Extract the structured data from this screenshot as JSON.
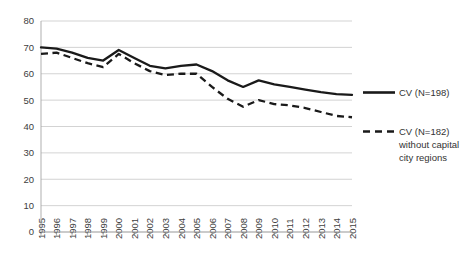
{
  "chart_data": {
    "type": "line",
    "title": "",
    "subtitle": "",
    "xlabel": "",
    "ylabel": "",
    "grid": true,
    "legend_position": "right",
    "ylim": [
      0,
      80
    ],
    "ytick_labels": [
      "80",
      "70",
      "60",
      "50",
      "40",
      "30",
      "20",
      "10",
      "0"
    ],
    "yticks": [
      80,
      70,
      60,
      50,
      40,
      30,
      20,
      10,
      0
    ],
    "categories": [
      "1995",
      "1996",
      "1997",
      "1998",
      "1999",
      "2000",
      "2001",
      "2002",
      "2003",
      "2004",
      "2005",
      "2006",
      "2007",
      "2008",
      "2009",
      "2010",
      "2011",
      "2012",
      "2013",
      "2014",
      "2015"
    ],
    "series": [
      {
        "name": "CV (N=198)",
        "style": "solid",
        "color": "#1a1a1a",
        "values": [
          70,
          69.5,
          68,
          66,
          65,
          69,
          66,
          63,
          62,
          63,
          63.5,
          61,
          57.5,
          55,
          57.5,
          56,
          55,
          54,
          53,
          52.3,
          52
        ]
      },
      {
        "name": "CV (N=182) without capital city regions",
        "style": "dashed",
        "color": "#1a1a1a",
        "values": [
          67.5,
          68,
          66,
          64,
          62.5,
          67.5,
          64,
          61,
          59.5,
          60,
          60,
          55,
          50.5,
          47.5,
          50,
          48.5,
          48,
          47,
          45.5,
          44,
          43.5
        ]
      }
    ]
  },
  "legend": {
    "entries": [
      {
        "line1": "CV (N=198)",
        "line2": "",
        "line3": ""
      },
      {
        "line1": "CV (N=182)",
        "line2": "without capital",
        "line3": "city regions"
      }
    ]
  }
}
